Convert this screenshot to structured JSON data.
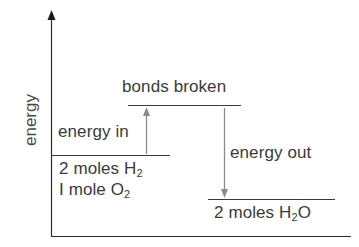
{
  "diagram": {
    "type": "energy-level-diagram",
    "y_axis_label": "energy",
    "levels": {
      "bonds_broken": {
        "label": "bonds broken"
      },
      "reactants": {
        "line1_prefix": "2 moles H",
        "line1_sub": "2",
        "line2_prefix": "I mole O",
        "line2_sub": "2"
      },
      "products": {
        "prefix": "2 moles H",
        "sub": "2",
        "suffix": "O"
      }
    },
    "arrows": {
      "energy_in": {
        "label": "energy in",
        "direction": "up"
      },
      "energy_out": {
        "label": "energy out",
        "direction": "down"
      }
    },
    "colors": {
      "axis": "#2a2a2a",
      "level_line": "#3a3a3a",
      "arrow": "#8a8a8a",
      "text": "#3a3a3a"
    }
  }
}
